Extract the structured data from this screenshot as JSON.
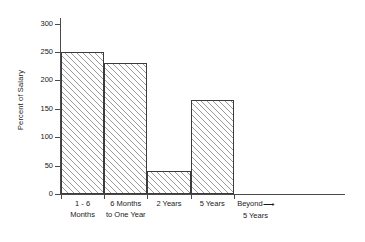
{
  "chart_data": {
    "type": "bar",
    "title": "",
    "xlabel": "",
    "ylabel": "Percent of Salary",
    "categories": [
      "1 - 6 Months",
      "6 Months to One Year",
      "2 Years",
      "5 Years",
      "Beyond 5 Years"
    ],
    "category_lines": [
      {
        "line1": "1 - 6",
        "line2": "Months"
      },
      {
        "line1": "6 Months",
        "line2": "to One Year"
      },
      {
        "line1": "2 Years",
        "line2": ""
      },
      {
        "line1": "5 Years",
        "line2": ""
      },
      {
        "line1": "Beyond",
        "line2": "5 Years"
      }
    ],
    "values": [
      250,
      230,
      40,
      165,
      null
    ],
    "ylim": [
      0,
      310
    ],
    "yticks": [
      0,
      50,
      100,
      150,
      200,
      250,
      300
    ],
    "ytick_labels": [
      "0",
      "50",
      "100",
      "150",
      "200",
      "250",
      "300"
    ],
    "grid": false,
    "legend": null,
    "annotations": [
      {
        "name": "continuation-arrow",
        "glyph": "⟶",
        "near_category": "Beyond 5 Years",
        "meaning": "axis continues beyond 5 years"
      }
    ],
    "colors": {
      "bar_fill": "#ffffff",
      "bar_hatch": "#9a9a9a",
      "bar_edge": "#3c3c3c",
      "axis": "#4a4a4a",
      "text": "#1a1a1a",
      "background": "#ffffff"
    }
  },
  "axis": {
    "y_title": "Percent of Salary"
  }
}
